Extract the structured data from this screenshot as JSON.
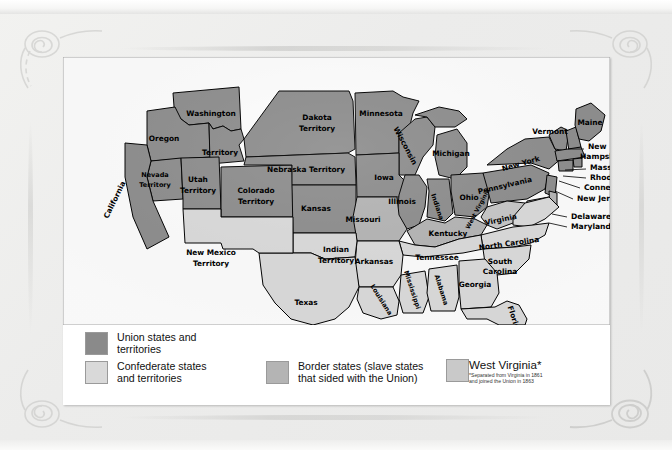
{
  "document": {
    "type": "historical-map",
    "title": "United States during the Civil War"
  },
  "legend": {
    "items": [
      {
        "key": "union",
        "label": "Union states and\nterritories",
        "color": "#8a8a8a"
      },
      {
        "key": "confederate",
        "label": "Confederate states\nand territories",
        "color": "#d9d9d9"
      },
      {
        "key": "border",
        "label": "Border states (slave states\nthat sided with the Union)",
        "color": "#b4b4b4"
      },
      {
        "key": "westvirginia",
        "label": "West Virginia*",
        "color": "#c9c9c9",
        "note": "*Separated from Virginia in 1861\nand joined the Union in 1863"
      }
    ]
  },
  "map": {
    "labels": [
      {
        "name": "washington",
        "text": "Washington",
        "x": 148,
        "y": 57,
        "cls": "mlabel"
      },
      {
        "name": "washington-territory",
        "text": "Territory",
        "x": 157,
        "y": 96,
        "cls": "mlabel"
      },
      {
        "name": "oregon",
        "text": "Oregon",
        "x": 101,
        "y": 82,
        "cls": "mlabel"
      },
      {
        "name": "california",
        "text": "California",
        "x": 52,
        "y": 143,
        "cls": "mlabel",
        "rot": -64
      },
      {
        "name": "nevada-territory-1",
        "text": "Nevada",
        "x": 92,
        "y": 118,
        "cls": "mlabel sm"
      },
      {
        "name": "nevada-territory-2",
        "text": "Territory",
        "x": 92,
        "y": 128,
        "cls": "mlabel sm"
      },
      {
        "name": "utah-territory-1",
        "text": "Utah",
        "x": 135,
        "y": 123,
        "cls": "mlabel"
      },
      {
        "name": "utah-territory-2",
        "text": "Territory",
        "x": 135,
        "y": 134,
        "cls": "mlabel"
      },
      {
        "name": "colorado-territory-1",
        "text": "Colorado",
        "x": 193,
        "y": 134,
        "cls": "mlabel"
      },
      {
        "name": "colorado-territory-2",
        "text": "Territory",
        "x": 193,
        "y": 145,
        "cls": "mlabel"
      },
      {
        "name": "dakota-territory-1",
        "text": "Dakota",
        "x": 254,
        "y": 61,
        "cls": "mlabel"
      },
      {
        "name": "dakota-territory-2",
        "text": "Territory",
        "x": 254,
        "y": 72,
        "cls": "mlabel"
      },
      {
        "name": "nebraska-territory",
        "text": "Nebraska Territory",
        "x": 243,
        "y": 113,
        "cls": "mlabel"
      },
      {
        "name": "kansas",
        "text": "Kansas",
        "x": 253,
        "y": 152,
        "cls": "mlabel"
      },
      {
        "name": "minnesota",
        "text": "Minnesota",
        "x": 318,
        "y": 57,
        "cls": "mlabel"
      },
      {
        "name": "wisconsin",
        "text": "Wisconsin",
        "x": 342,
        "y": 89,
        "cls": "mlabel",
        "rot": 62
      },
      {
        "name": "iowa",
        "text": "Iowa",
        "x": 321,
        "y": 121,
        "cls": "mlabel"
      },
      {
        "name": "michigan",
        "text": "Michigan",
        "x": 388,
        "y": 97,
        "cls": "mlabel"
      },
      {
        "name": "illinois",
        "text": "Illinois",
        "x": 339,
        "y": 145,
        "cls": "mlabel"
      },
      {
        "name": "indiana",
        "text": "Indiana",
        "x": 374,
        "y": 150,
        "cls": "mlabel sm",
        "rot": 72
      },
      {
        "name": "ohio",
        "text": "Ohio",
        "x": 406,
        "y": 141,
        "cls": "mlabel"
      },
      {
        "name": "missouri",
        "text": "Missouri",
        "x": 300,
        "y": 163,
        "cls": "mlabel"
      },
      {
        "name": "kentucky",
        "text": "Kentucky",
        "x": 385,
        "y": 177,
        "cls": "mlabel"
      },
      {
        "name": "tennessee",
        "text": "Tennessee",
        "x": 374,
        "y": 201,
        "cls": "mlabel"
      },
      {
        "name": "arkansas",
        "text": "Arkansas",
        "x": 311,
        "y": 205,
        "cls": "mlabel"
      },
      {
        "name": "indian-territory-1",
        "text": "Indian",
        "x": 273,
        "y": 193,
        "cls": "mlabel"
      },
      {
        "name": "indian-territory-2",
        "text": "Territory",
        "x": 273,
        "y": 204,
        "cls": "mlabel"
      },
      {
        "name": "texas",
        "text": "Texas",
        "x": 243,
        "y": 246,
        "cls": "mlabel"
      },
      {
        "name": "new-mexico-1",
        "text": "New Mexico",
        "x": 148,
        "y": 196,
        "cls": "mlabel"
      },
      {
        "name": "new-mexico-2",
        "text": "Territory",
        "x": 148,
        "y": 207,
        "cls": "mlabel"
      },
      {
        "name": "louisiana",
        "text": "Louisiana",
        "x": 318,
        "y": 243,
        "cls": "mlabel sm",
        "rot": 58
      },
      {
        "name": "mississippi",
        "text": "Mississippi",
        "x": 349,
        "y": 233,
        "cls": "mlabel sm",
        "rot": 72
      },
      {
        "name": "alabama",
        "text": "Alabama",
        "x": 378,
        "y": 233,
        "cls": "mlabel sm",
        "rot": 72
      },
      {
        "name": "georgia",
        "text": "Georgia",
        "x": 412,
        "y": 228,
        "cls": "mlabel"
      },
      {
        "name": "florida",
        "text": "Florida",
        "x": 451,
        "y": 263,
        "cls": "mlabel",
        "rot": 72
      },
      {
        "name": "south-carolina-1",
        "text": "South",
        "x": 437,
        "y": 205,
        "cls": "mlabel"
      },
      {
        "name": "south-carolina-2",
        "text": "Carolina",
        "x": 437,
        "y": 215,
        "cls": "mlabel"
      },
      {
        "name": "north-carolina",
        "text": "North Carolina",
        "x": 446,
        "y": 187,
        "cls": "mlabel",
        "rot": -8
      },
      {
        "name": "virginia",
        "text": "Virginia",
        "x": 438,
        "y": 163,
        "cls": "mlabel",
        "rot": -12
      },
      {
        "name": "west-virginia",
        "text": "West Virginia",
        "x": 415,
        "y": 152,
        "cls": "mlabel xs",
        "rot": -62
      },
      {
        "name": "pennsylvania",
        "text": "Pennsylvania",
        "x": 442,
        "y": 129,
        "cls": "mlabel",
        "rot": -13
      },
      {
        "name": "new-york",
        "text": "New York",
        "x": 458,
        "y": 107,
        "cls": "mlabel",
        "rot": -16
      },
      {
        "name": "vermont",
        "text": "Vermont",
        "x": 487,
        "y": 75,
        "cls": "mlabel"
      },
      {
        "name": "maine",
        "text": "Maine",
        "x": 527,
        "y": 66,
        "cls": "mlabel"
      }
    ],
    "callouts": [
      {
        "name": "new-hampshire",
        "lines": [
          "New",
          "Hampshire"
        ],
        "x": 525,
        "y": 90,
        "leader": "M 505 92 L 521 92"
      },
      {
        "name": "massachusetts",
        "lines": [
          "Massachusetts"
        ],
        "x": 527,
        "y": 111,
        "leader": "M 502 113 L 523 112"
      },
      {
        "name": "rhode-island",
        "lines": [
          "Rhode Island"
        ],
        "x": 527,
        "y": 121,
        "leader": "M 500 119 L 523 121"
      },
      {
        "name": "connecticut",
        "lines": [
          "Connecticut"
        ],
        "x": 521,
        "y": 131,
        "leader": "M 496 124 L 517 131"
      },
      {
        "name": "new-jersey",
        "lines": [
          "New Jersey"
        ],
        "x": 514,
        "y": 142,
        "leader": "M 492 134 L 510 142"
      },
      {
        "name": "delaware",
        "lines": [
          "Delaware"
        ],
        "x": 508,
        "y": 160,
        "leader": "M 489 157 L 504 160"
      },
      {
        "name": "maryland",
        "lines": [
          "Maryland"
        ],
        "x": 508,
        "y": 170,
        "leader": "M 486 166 L 504 170"
      }
    ]
  }
}
